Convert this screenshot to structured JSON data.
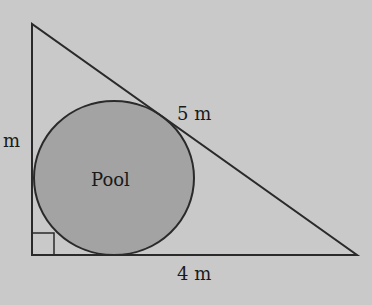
{
  "diagram": {
    "colors": {
      "background": "#c9c9c9",
      "stroke": "#2a2a2a",
      "pool_fill": "#a3a3a3"
    },
    "triangle": {
      "vertices": {
        "apex": [
          32,
          24
        ],
        "right_angle": [
          32,
          255
        ],
        "right": [
          357,
          255
        ]
      },
      "right_angle_marker": true
    },
    "pool": {
      "label": "Pool",
      "cx": 114,
      "cy": 178,
      "rx": 80,
      "ry": 77
    },
    "labels": {
      "left_side": "m",
      "hypotenuse": "5 m",
      "base": "4 m"
    }
  }
}
